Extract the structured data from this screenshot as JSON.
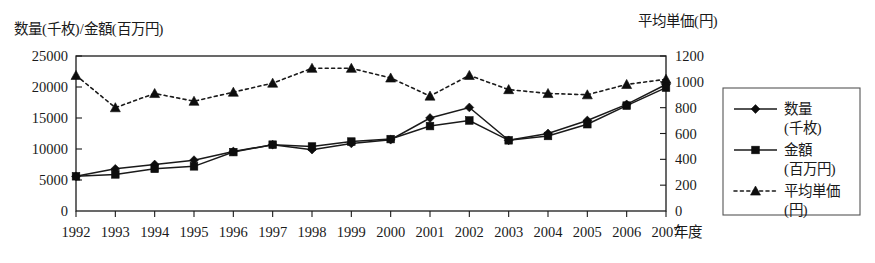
{
  "chart_data": {
    "type": "line",
    "title": "",
    "ylabel": "数量(千枚)/金額(百万円)",
    "y2label": "平均単価(円)",
    "xlabel": "年度",
    "categories": [
      "1992",
      "1993",
      "1994",
      "1995",
      "1996",
      "1997",
      "1998",
      "1999",
      "2000",
      "2001",
      "2002",
      "2003",
      "2004",
      "2005",
      "2006",
      "2007"
    ],
    "ylim": [
      0,
      25000
    ],
    "yticks": [
      "0",
      "5000",
      "10000",
      "15000",
      "20000",
      "25000"
    ],
    "y2lim": [
      0,
      1200
    ],
    "y2ticks": [
      "0",
      "200",
      "400",
      "600",
      "800",
      "1000",
      "1200"
    ],
    "grid": false,
    "legend_position": "right-outside",
    "series": [
      {
        "name": "数量\n(千枚)",
        "name_line1": "数量",
        "name_line2": "(千枚)",
        "axis": "left",
        "marker": "diamond",
        "linestyle": "solid",
        "values": [
          5600,
          6800,
          7500,
          8200,
          9600,
          10700,
          9900,
          10900,
          11500,
          15000,
          16700,
          11400,
          12500,
          14600,
          17200,
          20400
        ]
      },
      {
        "name": "金額\n(百万円)",
        "name_line1": "金額",
        "name_line2": "(百万円)",
        "axis": "left",
        "marker": "square",
        "linestyle": "solid",
        "values": [
          5600,
          5900,
          6800,
          7200,
          9500,
          10700,
          10400,
          11200,
          11600,
          13700,
          14600,
          11400,
          12100,
          14000,
          17000,
          19900
        ]
      },
      {
        "name": "平均単価\n(円)",
        "name_line1": "平均単価",
        "name_line2": "(円)",
        "axis": "right",
        "marker": "triangle",
        "linestyle": "dotted",
        "values": [
          1050,
          800,
          910,
          850,
          920,
          990,
          1105,
          1105,
          1030,
          890,
          1050,
          940,
          910,
          900,
          980,
          1020
        ]
      }
    ]
  },
  "legend": {
    "entries": [
      {
        "label_line1": "数量",
        "label_line2": "(千枚)",
        "marker": "diamond",
        "linestyle": "solid"
      },
      {
        "label_line1": "金額",
        "label_line2": "(百万円)",
        "marker": "square",
        "linestyle": "solid"
      },
      {
        "label_line1": "平均単価",
        "label_line2": "(円)",
        "marker": "triangle",
        "linestyle": "dotted"
      }
    ]
  }
}
